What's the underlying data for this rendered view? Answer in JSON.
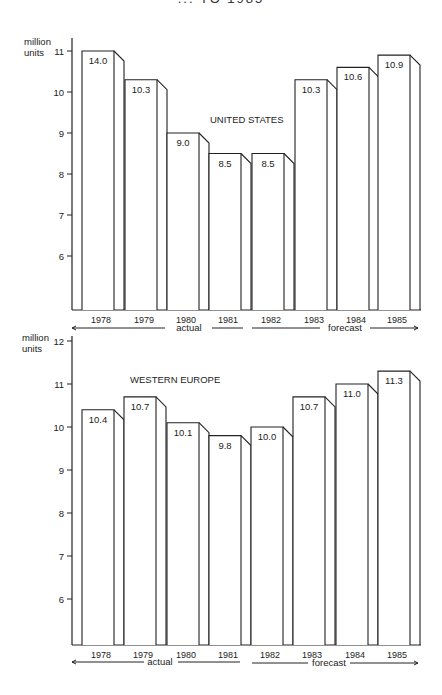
{
  "title": "... TO 1985",
  "chart_data": [
    {
      "type": "bar",
      "title": "UNITED STATES",
      "ylabel": "million units",
      "xlabel": "",
      "categories": [
        "1978",
        "1979",
        "1980",
        "1981",
        "1982",
        "1983",
        "1984",
        "1985"
      ],
      "values": [
        14.0,
        10.3,
        9.0,
        8.5,
        8.5,
        10.3,
        10.6,
        10.9
      ],
      "value_labels": [
        "14.0",
        "10.3",
        "9.0",
        "8.5",
        "8.5",
        "10.3",
        "10.6",
        "10.9"
      ],
      "yticks": [
        6,
        7,
        8,
        9,
        10,
        11
      ],
      "ylim": [
        4.7,
        11
      ],
      "note": "1978 bar drawn truncated at axis top (11)",
      "periods": [
        {
          "label": "actual",
          "categories": [
            "1978",
            "1979",
            "1980",
            "1981"
          ]
        },
        {
          "label": "forecast",
          "categories": [
            "1982",
            "1983",
            "1984",
            "1985"
          ]
        }
      ],
      "grid": false,
      "style": "3d-outline"
    },
    {
      "type": "bar",
      "title": "WESTERN EUROPE",
      "ylabel": "million units",
      "xlabel": "",
      "categories": [
        "1978",
        "1979",
        "1980",
        "1981",
        "1982",
        "1983",
        "1984",
        "1985"
      ],
      "values": [
        10.4,
        10.7,
        10.1,
        9.8,
        10.0,
        10.7,
        11.0,
        11.3
      ],
      "value_labels": [
        "10.4",
        "10.7",
        "10.1",
        "9.8",
        "10.0",
        "10.7",
        "11.0",
        "11.3"
      ],
      "yticks": [
        6,
        7,
        8,
        9,
        10,
        11,
        12
      ],
      "ylim": [
        4.95,
        12
      ],
      "periods": [
        {
          "label": "actual",
          "categories": [
            "1978",
            "1979",
            "1980",
            "1981"
          ]
        },
        {
          "label": "forecast",
          "categories": [
            "1982",
            "1983",
            "1984",
            "1985"
          ]
        }
      ],
      "grid": false,
      "style": "3d-outline"
    }
  ],
  "layout": [
    {
      "axis_x": 72,
      "axis_top": 38,
      "baseline_y": 310,
      "top_value": 11,
      "top_value_y": 51,
      "px_per_unit": 41,
      "clip_value": 11,
      "bar_front_x": [
        82,
        125,
        167,
        209,
        252,
        295,
        337,
        378
      ],
      "bar_front_w": 32,
      "depth": 10,
      "drop": 10,
      "title_x": 210,
      "title_y": 123,
      "unit_label_y": 41,
      "year_y": 323,
      "actual_line": [
        [
          72,
          165
        ],
        [
          212,
          243
        ]
      ],
      "actual_label_x": 189,
      "actual_label_y": 331,
      "forecast_line": [
        [
          252,
          320
        ],
        [
          370,
          418
        ]
      ],
      "forecast_label_x": 345,
      "forecast_label_y": 331
    },
    {
      "axis_x": 72,
      "axis_top": 336,
      "baseline_y": 645,
      "top_value": 12,
      "top_value_y": 341,
      "px_per_unit": 43,
      "clip_value": 12,
      "bar_front_x": [
        82,
        124,
        167,
        209,
        251,
        293,
        336,
        378
      ],
      "bar_front_w": 32,
      "depth": 10,
      "drop": 10,
      "title_x": 130,
      "title_y": 383,
      "unit_label_y": 336,
      "year_y": 658,
      "actual_line": [
        [
          72,
          144
        ],
        [
          178,
          240
        ]
      ],
      "actual_label_x": 160,
      "actual_label_y": 665,
      "forecast_line": [
        [
          252,
          308
        ],
        [
          350,
          418
        ]
      ],
      "forecast_label_x": 329,
      "forecast_label_y": 666
    }
  ]
}
